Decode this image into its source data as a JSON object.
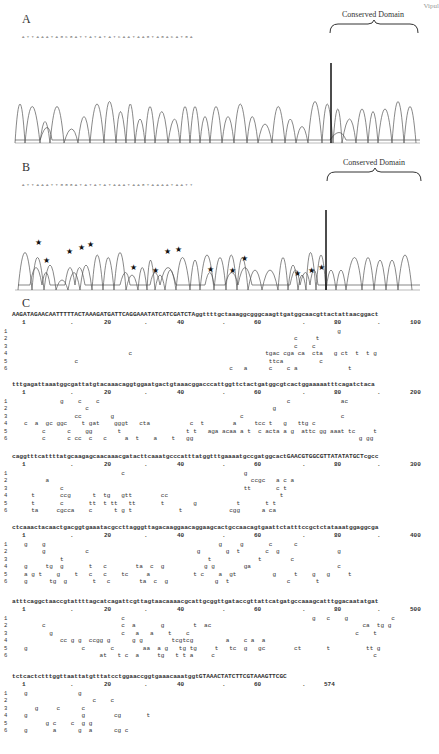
{
  "figure": {
    "corner_text": "Vipul",
    "panels": [
      {
        "label": "A",
        "conserved_domain_label": "Conserved Domain",
        "position_markers": [
          "55",
          "60",
          "70",
          "80"
        ],
        "bases": "A T T A A A T A G C G A T T A T A T A T C A A T A A G T A G A C A T G A",
        "stars": []
      },
      {
        "label": "B",
        "conserved_domain_label": "Conserved Domain",
        "position_markers": [
          "60",
          "70",
          "80"
        ],
        "bases": "A T T A A A T T G G G A T A T A T A T A A A T A A G T A A A A T A A T T",
        "stars_count": 18
      }
    ],
    "panel_c": {
      "label": "C",
      "blocks": [
        {
          "ref": "AAGATAGAACAATTTTTACTAAAGATGATTCAGGAAATATCATCGATCTAggttttgctaaaggcgggcaagttgatggcaacgttactattaacggact",
          "ruler": [
            "1",
            ".",
            "20",
            ".",
            "40",
            ".",
            "60",
            ".",
            "80",
            ".",
            "100"
          ],
          "rows": [
            {
              "n": "1",
              "v": "                                                                                       g"
            },
            {
              "n": "2",
              "v": "                                                                           c     t"
            },
            {
              "n": "3",
              "v": "                                                                           c    c"
            },
            {
              "n": "4",
              "v": "                             c                                     tgac cga ca  cta   g ct  t  t g"
            },
            {
              "n": "5",
              "v": "              c                                                     ttca          c"
            },
            {
              "n": "6",
              "v": "                                                         c   a      c    c a              t"
            }
          ]
        },
        {
          "ref": "tttgagattaaatggcgattatgtacaaacaggtggaatgactgtaaacggacccattggttctactgatggcgtcactggaaaaatttcagatctaca",
          "ruler": [
            "1",
            ".",
            "20",
            ".",
            "40",
            ".",
            "60",
            ".",
            "80",
            ".",
            "200"
          ],
          "rows": [
            {
              "n": "1",
              "v": "          g    c    c                                                    c              ac"
            },
            {
              "n": "2",
              "v": "                 c                                                   g"
            },
            {
              "n": "3",
              "v": "              cc        g                                   c                           c"
            },
            {
              "n": "4",
              "v": "c  a  gc ggc    t gat    gggt   cta           c  t        a     tcc t   g   ttg c"
            },
            {
              "n": "5",
              "v": "     c      c    gg       t                  t t   aga acaa a t  c acta a g  attc gg aaat tc     t"
            },
            {
              "n": "6",
              "v": "     c      c cc  c   c     a  t    a    t   gg                                              g gg"
            }
          ]
        },
        {
          "ref": "caggtttcattttatgcaagagcaacaaacgatacttcaaatgcccatttatggtttgaaaatgccgatggcactGAACGTGGCGTTATATATGCTcgcc",
          "ruler": [
            "1",
            ".",
            "20",
            ".",
            "40",
            ".",
            "60",
            ".",
            "80",
            ".",
            "300"
          ],
          "rows": [
            {
              "n": "1",
              "v": "                           c                                 g"
            },
            {
              "n": "2",
              "v": "      a                                                        ccgc   a c a"
            },
            {
              "n": "3",
              "v": "          c                                                  tt       c t"
            },
            {
              "n": "4",
              "v": "  t       ccg      t  tg   gtt        cc                               t"
            },
            {
              "n": "5",
              "v": "  t       c       tt  t tt   tt       t        g           t       t t"
            },
            {
              "n": "6",
              "v": "  ta     cgcca    c      t g t             t             cgg      a ca"
            }
          ]
        },
        {
          "ref": "ctcaaactacaactgacggtgaaatacgccttagggttagacaaggaacaggaagcactgccaacagtgaattctatttccgctctataaatggaggcga",
          "ruler": [
            "1",
            ".",
            "20",
            ".",
            "40",
            ".",
            "60",
            ".",
            "80",
            ".",
            "400"
          ],
          "rows": [
            {
              "n": "1",
              "v": "g    g                                                g     g       c      c"
            },
            {
              "n": "2",
              "v": "     g           c                              g       g  t       c  g                g"
            },
            {
              "n": "3",
              "v": "          t                                        t             t        c"
            },
            {
              "n": "4",
              "v": "g     tg  g       t   c        ta  c  g           g g        ga                        c"
            },
            {
              "n": "5",
              "v": "a g t    g    t   c   c    tc     a            t c    a  gt          g     t    g   g     t"
            },
            {
              "n": "6",
              "v": "g      tg  g       t   c        ta  c  g             g  t                c       t"
            }
          ]
        },
        {
          "ref": "atttcaggctaaccgtattttagcatcagattcgttagtaacaaaacgcattgcggttgataccgttattcatgatgccaaagcatttggacaatatgat",
          "ruler": [
            "1",
            ".",
            "20",
            ".",
            "40",
            ".",
            "60",
            ".",
            "80",
            ".",
            "500"
          ],
          "rows": [
            {
              "n": "1",
              "v": "                           c                                                    g   c    g            c"
            },
            {
              "n": "2",
              "v": "     c                     c  a       g        t  ac                                          ca  tg g"
            },
            {
              "n": "3",
              "v": "       g                   c   a   a    t    c                                              c    t"
            },
            {
              "n": "4",
              "v": "          cc g g  ccgg g      g g        tcgtcg         a    c a  a"
            },
            {
              "n": "5",
              "v": "g               c       c        aa  a g   tg tg     t   tc  g   gc        ct       t          tt g"
            },
            {
              "n": "6",
              "v": "                     at   t c  a     tg   t t a     c                                            c"
            }
          ]
        },
        {
          "ref": "tctcactctttggttaattatgtttatcctggaaccggtgaaacaaatggtGTAAACTATCTTCGTAAAGTTCGC",
          "ruler": [
            "1",
            ".",
            "20",
            ".",
            "40",
            ".",
            "60",
            ".",
            "574"
          ],
          "rows": [
            {
              "n": "1",
              "v": "g              g"
            },
            {
              "n": "2",
              "v": "                   c    c"
            },
            {
              "n": "3",
              "v": "   g     c      c"
            },
            {
              "n": "4",
              "v": "g               g        cg       t"
            },
            {
              "n": "5",
              "v": "      g c    c  g g"
            },
            {
              "n": "6",
              "v": "g       a      g  a      cg c"
            }
          ]
        }
      ]
    }
  }
}
